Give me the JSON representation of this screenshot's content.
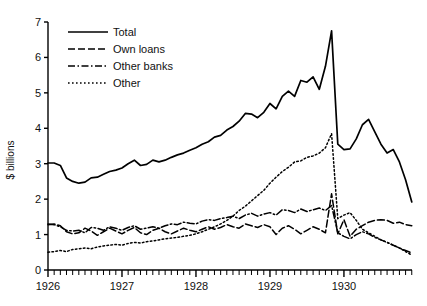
{
  "chart_data": {
    "type": "line",
    "title": "",
    "xlabel": "",
    "ylabel": "$ billions",
    "xlim": [
      1926.0,
      1930.92
    ],
    "ylim": [
      0,
      7
    ],
    "yticks": [
      0,
      1,
      2,
      3,
      4,
      5,
      6,
      7
    ],
    "xticks": [
      1926,
      1927,
      1928,
      1929,
      1930
    ],
    "xtick_labels": [
      "1926",
      "1927",
      "1928",
      "1929",
      "1930"
    ],
    "ytick_labels": [
      "0",
      "1",
      "2",
      "3",
      "4",
      "5",
      "6",
      "7"
    ],
    "x_minor_ticks": "monthly",
    "grid": false,
    "legend_position": "upper-left-inside",
    "x": [
      1926.0,
      1926.083,
      1926.167,
      1926.25,
      1926.333,
      1926.417,
      1926.5,
      1926.583,
      1926.667,
      1926.75,
      1926.833,
      1926.917,
      1927.0,
      1927.083,
      1927.167,
      1927.25,
      1927.333,
      1927.417,
      1927.5,
      1927.583,
      1927.667,
      1927.75,
      1927.833,
      1927.917,
      1928.0,
      1928.083,
      1928.167,
      1928.25,
      1928.333,
      1928.417,
      1928.5,
      1928.583,
      1928.667,
      1928.75,
      1928.833,
      1928.917,
      1929.0,
      1929.083,
      1929.167,
      1929.25,
      1929.333,
      1929.417,
      1929.5,
      1929.583,
      1929.667,
      1929.75,
      1929.833,
      1929.917,
      1930.0,
      1930.083,
      1930.167,
      1930.25,
      1930.333,
      1930.417,
      1930.5,
      1930.583,
      1930.667,
      1930.75,
      1930.833,
      1930.917
    ],
    "series": [
      {
        "name": "Total",
        "style": "solid",
        "values": [
          3.02,
          3.02,
          2.95,
          2.6,
          2.5,
          2.45,
          2.48,
          2.6,
          2.62,
          2.7,
          2.78,
          2.82,
          2.88,
          3.0,
          3.1,
          2.95,
          2.98,
          3.1,
          3.05,
          3.1,
          3.18,
          3.25,
          3.3,
          3.38,
          3.45,
          3.55,
          3.62,
          3.75,
          3.8,
          3.95,
          4.05,
          4.2,
          4.42,
          4.4,
          4.3,
          4.45,
          4.7,
          4.55,
          4.9,
          5.05,
          4.9,
          5.35,
          5.3,
          5.45,
          5.1,
          5.75,
          6.75,
          3.55,
          3.4,
          3.42,
          3.7,
          4.1,
          4.25,
          3.9,
          3.55,
          3.3,
          3.4,
          3.05,
          2.55,
          1.92
        ]
      },
      {
        "name": "Own loans",
        "style": "dashed",
        "values": [
          1.28,
          1.3,
          1.25,
          1.08,
          1.02,
          1.05,
          1.18,
          1.1,
          0.98,
          1.08,
          1.18,
          1.1,
          1.02,
          1.12,
          1.2,
          1.05,
          1.0,
          1.12,
          1.18,
          1.08,
          1.02,
          1.1,
          1.18,
          1.12,
          1.08,
          1.15,
          1.22,
          1.15,
          1.2,
          1.28,
          1.22,
          1.18,
          1.3,
          1.25,
          1.2,
          1.28,
          1.22,
          1.0,
          1.18,
          1.25,
          1.15,
          1.02,
          1.12,
          1.22,
          1.15,
          1.05,
          2.15,
          1.02,
          1.42,
          0.95,
          1.15,
          1.25,
          1.35,
          1.4,
          1.42,
          1.4,
          1.32,
          1.35,
          1.28,
          1.25
        ]
      },
      {
        "name": "Other banks",
        "style": "dashdot",
        "values": [
          1.3,
          1.28,
          1.22,
          1.12,
          1.1,
          1.12,
          1.05,
          1.2,
          1.18,
          1.12,
          1.22,
          1.18,
          1.12,
          1.2,
          1.25,
          1.15,
          1.18,
          1.22,
          1.18,
          1.25,
          1.3,
          1.28,
          1.35,
          1.32,
          1.3,
          1.38,
          1.42,
          1.4,
          1.45,
          1.48,
          1.52,
          1.45,
          1.55,
          1.6,
          1.52,
          1.58,
          1.62,
          1.55,
          1.7,
          1.68,
          1.62,
          1.72,
          1.65,
          1.7,
          1.75,
          1.68,
          1.82,
          1.05,
          0.95,
          0.88,
          1.0,
          1.08,
          1.02,
          0.92,
          0.85,
          0.78,
          0.7,
          0.62,
          0.55,
          0.48
        ]
      },
      {
        "name": "Other",
        "style": "dotted",
        "values": [
          0.5,
          0.52,
          0.55,
          0.52,
          0.58,
          0.6,
          0.62,
          0.6,
          0.65,
          0.68,
          0.7,
          0.72,
          0.7,
          0.75,
          0.78,
          0.76,
          0.8,
          0.82,
          0.85,
          0.88,
          0.9,
          0.92,
          0.95,
          0.98,
          1.02,
          1.08,
          1.15,
          1.22,
          1.3,
          1.4,
          1.52,
          1.68,
          1.8,
          1.95,
          2.1,
          2.25,
          2.45,
          2.62,
          2.78,
          2.9,
          3.05,
          3.08,
          3.18,
          3.22,
          3.3,
          3.45,
          3.85,
          1.45,
          1.55,
          1.62,
          1.4,
          1.15,
          1.05,
          0.95,
          0.85,
          0.78,
          0.7,
          0.62,
          0.52,
          0.42
        ]
      }
    ]
  },
  "legend": {
    "items": [
      {
        "label": "Total",
        "style": "solid"
      },
      {
        "label": "Own loans",
        "style": "dashed"
      },
      {
        "label": "Other banks",
        "style": "dashdot"
      },
      {
        "label": "Other",
        "style": "dotted"
      }
    ]
  },
  "axes": {
    "y_axis_title": "$ billions"
  },
  "colors": {
    "line": "#000000",
    "axis": "#000000",
    "background": "#ffffff",
    "text": "#111111"
  }
}
